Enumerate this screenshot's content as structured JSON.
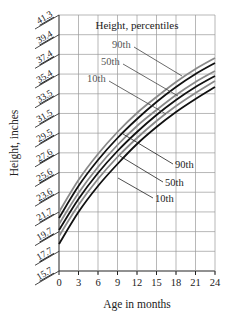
{
  "chart_data": {
    "type": "line",
    "title": "Height, percentiles",
    "xlabel": "Age in months",
    "ylabel": "Height, inches",
    "x": [
      0,
      3,
      6,
      9,
      12,
      15,
      18,
      21,
      24
    ],
    "x_ticks": [
      "0",
      "3",
      "6",
      "9",
      "12",
      "15",
      "18",
      "21",
      "24"
    ],
    "y_ticks": [
      "15.7",
      "17.7",
      "19.7",
      "21.7",
      "23.6",
      "25.6",
      "27.6",
      "29.5",
      "31.5",
      "33.5",
      "35.4",
      "37.4",
      "39.4",
      "41.3"
    ],
    "xlim": [
      0,
      24
    ],
    "ylim": [
      15.7,
      41.3
    ],
    "grid": true,
    "series": [
      {
        "name": "90th (gray)",
        "color": "#8a8a8a",
        "values": [
          21.6,
          24.8,
          27.4,
          29.6,
          31.5,
          33.1,
          34.6,
          35.9,
          37.0
        ]
      },
      {
        "name": "90th (black)",
        "color": "#111111",
        "values": [
          21.0,
          24.2,
          26.8,
          29.0,
          30.9,
          32.6,
          34.1,
          35.4,
          36.5
        ]
      },
      {
        "name": "50th (gray)",
        "color": "#8a8a8a",
        "values": [
          20.4,
          23.5,
          26.1,
          28.3,
          30.2,
          31.8,
          33.3,
          34.6,
          35.7
        ]
      },
      {
        "name": "50th (black)",
        "color": "#111111",
        "values": [
          19.8,
          22.9,
          25.5,
          27.7,
          29.6,
          31.3,
          32.8,
          34.1,
          35.2
        ]
      },
      {
        "name": "10th (gray)",
        "color": "#8a8a8a",
        "values": [
          19.2,
          22.3,
          24.9,
          27.1,
          29.0,
          30.7,
          32.2,
          33.5,
          34.7
        ]
      },
      {
        "name": "10th (black)",
        "color": "#111111",
        "values": [
          18.4,
          21.6,
          24.2,
          26.4,
          28.4,
          30.1,
          31.6,
          32.9,
          34.1
        ]
      }
    ],
    "annotations": {
      "gray_labels": [
        "90th",
        "50th",
        "10th"
      ],
      "black_labels": [
        "90th",
        "50th",
        "10th"
      ]
    },
    "legend_position": "top-center inside plot"
  },
  "labels": {
    "title": "Height, percentiles",
    "xlabel": "Age in months",
    "ylabel": "Height, inches",
    "gray90": "90th",
    "gray50": "50th",
    "gray10": "10th",
    "black90": "90th",
    "black50": "50th",
    "black10": "10th"
  }
}
